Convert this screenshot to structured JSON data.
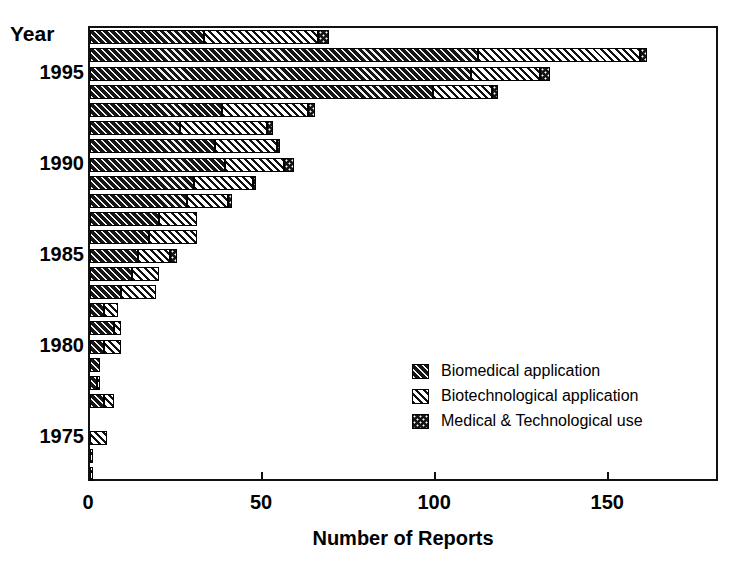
{
  "chart_data": {
    "type": "bar",
    "orientation": "horizontal",
    "stacked": true,
    "title": "",
    "xlabel": "Number of Reports",
    "ylabel": "Year",
    "xlim": [
      0,
      182
    ],
    "xticks": [
      0,
      50,
      100,
      150
    ],
    "xtick_labels": [
      "0",
      "50",
      "100",
      "150"
    ],
    "yticks": [
      1975,
      1980,
      1985,
      1990,
      1995
    ],
    "ytick_labels": [
      "1975",
      "1980",
      "1985",
      "1990",
      "1995"
    ],
    "grid": false,
    "legend_position": "lower right",
    "categories": [
      1997,
      1996,
      1995,
      1994,
      1993,
      1992,
      1991,
      1990,
      1989,
      1988,
      1987,
      1986,
      1985,
      1984,
      1983,
      1982,
      1981,
      1980,
      1979,
      1978,
      1977,
      1976,
      1975,
      1974,
      1973
    ],
    "series": [
      {
        "name": "Biomedical application",
        "pattern": "dark-diagonal-hatch",
        "values": [
          33,
          112,
          110,
          99,
          38,
          26,
          36,
          39,
          30,
          28,
          20,
          17,
          14,
          12,
          9,
          4,
          7,
          4,
          3,
          2,
          4,
          0,
          0,
          0,
          0
        ]
      },
      {
        "name": "Biotechnological application",
        "pattern": "white-diagonal-hatch",
        "values": [
          33,
          47,
          20,
          17,
          25,
          25,
          18,
          17,
          17,
          12,
          11,
          14,
          9,
          8,
          10,
          4,
          2,
          5,
          0,
          1,
          3,
          0,
          5,
          1,
          1
        ]
      },
      {
        "name": "Medical & Technological use",
        "pattern": "dark-dotted",
        "values": [
          3,
          2,
          3,
          2,
          2,
          2,
          1,
          3,
          1,
          1,
          0,
          0,
          2,
          0,
          0,
          0,
          0,
          0,
          0,
          0,
          0,
          0,
          0,
          0,
          0
        ]
      }
    ],
    "totals": [
      69,
      161,
      133,
      118,
      65,
      53,
      55,
      59,
      48,
      41,
      31,
      31,
      25,
      20,
      19,
      8,
      9,
      9,
      3,
      3,
      7,
      0,
      5,
      1,
      1
    ],
    "legend": [
      "Biomedical application",
      "Biotechnological application",
      "Medical & Technological use"
    ],
    "colors": {
      "biomedical": "#161616",
      "biotechnological": "#ffffff",
      "medical_technological": "#141414",
      "axis": "#111111",
      "background": "#ffffff"
    }
  }
}
